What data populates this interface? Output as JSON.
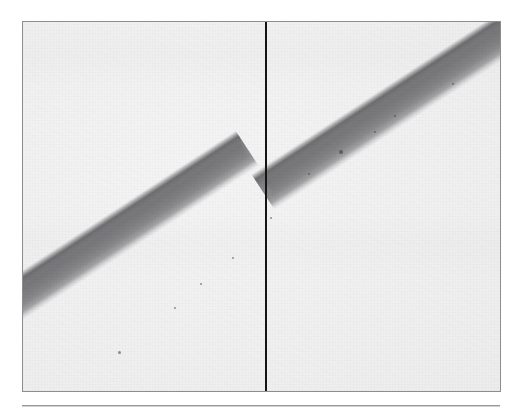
{
  "figure": {
    "kind": "photographic-plate",
    "caption": "",
    "label": ""
  },
  "plate": {
    "background_color": "#eeeeef",
    "border_color": "#8d8d8d",
    "left": 22,
    "top": 21,
    "width": 479,
    "height": 371
  },
  "band": {
    "name": "diagonal-band",
    "color_core": "#8a8a8d",
    "color_edge_dark": "#67676a",
    "color_edge_light": "#d2d2d4",
    "angle_deg": -33.2,
    "width_px": 42,
    "segments": [
      {
        "name": "band-segment-left",
        "enters_edge": "left",
        "exits_edge": "reference-line"
      },
      {
        "name": "band-segment-right",
        "enters_edge": "reference-line",
        "exits_edge": "top-right"
      }
    ],
    "offset_at_reference_line_px": 6
  },
  "reference_line": {
    "name": "vertical-reference-line",
    "color": "#141414",
    "x": 242,
    "width_px": 2,
    "orientation": "vertical",
    "spans_full_height": true
  },
  "caption_rule": {
    "color_top": "#9a9a9a",
    "color_bottom": "#cfcfcf"
  },
  "specks": [
    {
      "x": 318,
      "y": 130,
      "r": 1.6
    },
    {
      "x": 352,
      "y": 110,
      "r": 1.3
    },
    {
      "x": 372,
      "y": 94,
      "r": 1.1
    },
    {
      "x": 286,
      "y": 152,
      "r": 1.2
    },
    {
      "x": 210,
      "y": 236,
      "r": 1.4
    },
    {
      "x": 152,
      "y": 286,
      "r": 1.2
    },
    {
      "x": 96,
      "y": 330,
      "r": 1.5
    },
    {
      "x": 430,
      "y": 62,
      "r": 1.1
    },
    {
      "x": 248,
      "y": 196,
      "r": 1.2
    },
    {
      "x": 178,
      "y": 262,
      "r": 1.0
    }
  ]
}
